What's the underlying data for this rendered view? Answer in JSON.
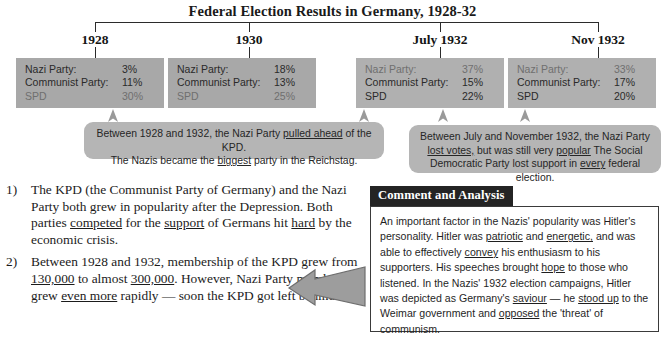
{
  "title": "Federal Election Results in Germany, 1928-32",
  "columns": [
    {
      "year": "1928",
      "rows": [
        {
          "party": "Nazi Party:",
          "value": "3%"
        },
        {
          "party": "Communist Party:",
          "value": "11%"
        },
        {
          "party": "SPD",
          "value": "30%"
        }
      ]
    },
    {
      "year": "1930",
      "rows": [
        {
          "party": "Nazi Party:",
          "value": "18%"
        },
        {
          "party": "Communist Party:",
          "value": "13%"
        },
        {
          "party": "SPD",
          "value": "25%"
        }
      ]
    },
    {
      "year": "July 1932",
      "rows": [
        {
          "party": "Nazi Party:",
          "value": "37%"
        },
        {
          "party": "Communist Party:",
          "value": "15%"
        },
        {
          "party": "SPD",
          "value": "22%"
        }
      ]
    },
    {
      "year": "Nov 1932",
      "rows": [
        {
          "party": "Nazi Party:",
          "value": "33%"
        },
        {
          "party": "Communist Party:",
          "value": "17%"
        },
        {
          "party": "SPD",
          "value": "20%"
        }
      ]
    }
  ],
  "callouts": {
    "left": {
      "line1_a": "Between 1928 and 1932, the Nazi Party ",
      "line1_u": "pulled ahead",
      "line1_b": " of the KPD.",
      "line2_a": "The Nazis became the ",
      "line2_u": "biggest",
      "line2_b": " party in the Reichstag."
    },
    "right": {
      "line1": "Between July and November 1932, the Nazi Party",
      "line2_u1": "lost votes,",
      "line2_a": " but was still very ",
      "line2_u2": "popular",
      "line2_b": "  The Social",
      "line3_a": "Democratic Party lost support in ",
      "line3_u": "every",
      "line3_b": " federal election."
    }
  },
  "notes": [
    {
      "num": "1)",
      "seg": [
        {
          "t": "The KPD (the Communist Party of Germany) and the Nazi Party both grew in popularity after the Depression.  Both parties ",
          "u": false
        },
        {
          "t": "competed",
          "u": true
        },
        {
          "t": " for the ",
          "u": false
        },
        {
          "t": "support",
          "u": true
        },
        {
          "t": " of Germans hit ",
          "u": false
        },
        {
          "t": "hard",
          "u": true
        },
        {
          "t": " by the economic crisis.",
          "u": false
        }
      ]
    },
    {
      "num": "2)",
      "seg": [
        {
          "t": "Between 1928 and 1932, membership of the KPD grew from ",
          "u": false
        },
        {
          "t": "130,000",
          "u": true
        },
        {
          "t": " to almost ",
          "u": false
        },
        {
          "t": "300,000",
          "u": true
        },
        {
          "t": ". However, Nazi Party membership grew ",
          "u": false
        },
        {
          "t": "even more",
          "u": true
        },
        {
          "t": " rapidly — soon the KPD got left behind.",
          "u": false
        }
      ]
    }
  ],
  "comment_panel": {
    "header": "Comment and Analysis",
    "seg": [
      {
        "t": "An important factor in the Nazis' popularity was Hitler's personality.  Hitler was ",
        "u": false
      },
      {
        "t": "patriotic",
        "u": true
      },
      {
        "t": " and ",
        "u": false
      },
      {
        "t": "energetic,",
        "u": true
      },
      {
        "t": " and was able to effectively ",
        "u": false
      },
      {
        "t": "convey",
        "u": true
      },
      {
        "t": " his enthusiasm to his supporters. His speeches brought ",
        "u": false
      },
      {
        "t": "hope",
        "u": true
      },
      {
        "t": " to those who listened.  In the Nazis' 1932 election campaigns, Hitler was depicted as Germany's ",
        "u": false
      },
      {
        "t": "saviour",
        "u": true
      },
      {
        "t": " — he ",
        "u": false
      },
      {
        "t": "stood up",
        "u": true
      },
      {
        "t": " to the Weimar government and ",
        "u": false
      },
      {
        "t": "opposed",
        "u": true
      },
      {
        "t": " the 'threat' of communism.",
        "u": false
      }
    ]
  },
  "colors": {
    "box_fill": "#a8a8a8",
    "callout_fill": "#b5b5b5",
    "panel_header_bg": "#242424",
    "panel_header_fg": "#ffffff",
    "text": "#1b1b1b",
    "arrow_fill": "#808080"
  }
}
